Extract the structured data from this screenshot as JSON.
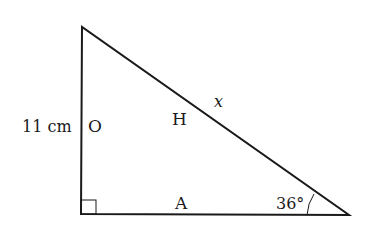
{
  "diagram": {
    "type": "right-triangle",
    "vertices": {
      "top": [
        82,
        27
      ],
      "right_angle": [
        81,
        214
      ],
      "angle_vertex": [
        349,
        215
      ]
    },
    "labels": {
      "side_length": "11 cm",
      "opposite": "O",
      "hypotenuse": "H",
      "unknown": "x",
      "adjacent": "A",
      "angle": "36°"
    },
    "colors": {
      "line": "#1a1a1a",
      "background": "#ffffff"
    }
  }
}
